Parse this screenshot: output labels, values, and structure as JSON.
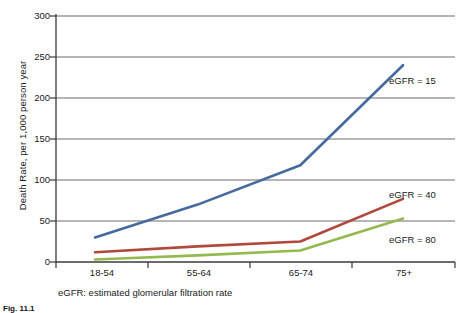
{
  "chart_data": {
    "type": "line",
    "title": "",
    "xlabel": "",
    "ylabel": "Death Rate, per 1,000 person year",
    "categories": [
      "18-54",
      "55-64",
      "65-74",
      "75+"
    ],
    "ylim": [
      0,
      300
    ],
    "yticks": [
      0,
      50,
      100,
      150,
      200,
      250,
      300
    ],
    "grid": true,
    "legend_position": "inline-right",
    "series": [
      {
        "name": "eGFR = 15",
        "color": "#46699e",
        "values": [
          30,
          70,
          118,
          240
        ]
      },
      {
        "name": "eGFR = 40",
        "color": "#b0483c",
        "values": [
          12,
          19,
          25,
          77
        ]
      },
      {
        "name": "eGFR = 80",
        "color": "#94b94f",
        "values": [
          3,
          8,
          14,
          53
        ]
      }
    ],
    "annotations": [
      "eGFR: estimated glomerular filtration rate"
    ]
  },
  "axis": {
    "y_title": "Death Rate, per 1,000 person year",
    "y_ticks": [
      "300",
      "250",
      "200",
      "150",
      "100",
      "50",
      "0"
    ],
    "x_ticks": [
      "18-54",
      "55-64",
      "65-74",
      "75+"
    ]
  },
  "series_labels": {
    "s1": "eGFR = 15",
    "s2": "eGFR = 40",
    "s3": "eGFR = 80"
  },
  "footnote": "eGFR: estimated glomerular filtration rate",
  "caption": "Fig. 11.1"
}
